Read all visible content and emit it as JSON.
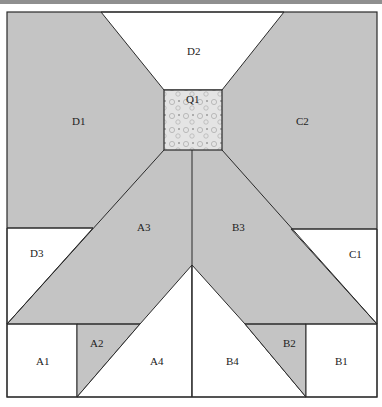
{
  "diagram": {
    "type": "quilt-block-template",
    "colors": {
      "gray_fill": "#c4c4c4",
      "white_fill": "#ffffff",
      "line": "#2a2a2a",
      "print_fill": "#e2e2e2",
      "top_bar": "#8f8f8f"
    },
    "pieces": {
      "D1": "D1",
      "D2": "D2",
      "D3": "D3",
      "C1": "C1",
      "C2": "C2",
      "Q1": "Q1",
      "A1": "A1",
      "A2": "A2",
      "A3": "A3",
      "A4": "A4",
      "B1": "B1",
      "B2": "B2",
      "B3": "B3",
      "B4": "B4"
    }
  }
}
